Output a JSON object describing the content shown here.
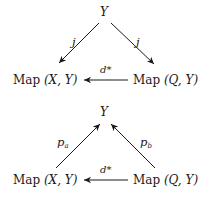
{
  "diagrams": [
    {
      "name": "top-commutative-diagram",
      "nodes": {
        "apex": "Y",
        "left": "Map (X, Y)",
        "left_prefix": "Map ",
        "left_args": "(X, Y)",
        "right": "Map (Q, Y)",
        "right_prefix": "Map ",
        "right_args": "(Q, Y)"
      },
      "arrows": {
        "apex_to_left": "j",
        "apex_to_right": "j",
        "right_to_left": "d*"
      }
    },
    {
      "name": "bottom-commutative-diagram",
      "nodes": {
        "apex": "Y",
        "left": "Map (X, Y)",
        "left_prefix": "Map ",
        "left_args": "(X, Y)",
        "right": "Map (Q, Y)",
        "right_prefix": "Map ",
        "right_args": "(Q, Y)"
      },
      "arrows": {
        "left_to_apex": "p",
        "left_to_apex_sub": "a",
        "right_to_apex": "p",
        "right_to_apex_sub": "b",
        "right_to_left": "d*"
      }
    }
  ]
}
